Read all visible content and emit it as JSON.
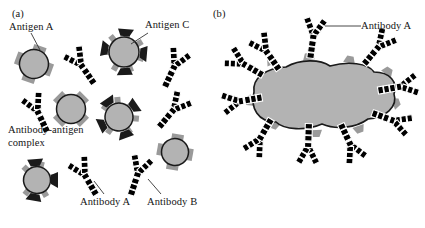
{
  "figure": {
    "background": "#ffffff",
    "width": 425,
    "height": 228
  },
  "panels": [
    {
      "id": "a",
      "label": "(a)",
      "label_pos": {
        "x": 12,
        "y": 10
      }
    },
    {
      "id": "b",
      "label": "(b)",
      "label_pos": {
        "x": 213,
        "y": 10
      }
    }
  ],
  "labels": {
    "antigen_a": "Antigen A",
    "antigen_c": "Antigen C",
    "antibody_antigen_complex": "Antibody-antigen complex",
    "antibody_a_panel_a": "Antibody A",
    "antibody_b_panel_a": "Antibody B",
    "antibody_a_panel_b": "Antibody A"
  },
  "colors": {
    "antigen_fill": "#b3b3b3",
    "antigen_stroke": "#1a1a1a",
    "epitope_gray": "#9a9a9a",
    "epitope_dark": "#1a1a1a",
    "antibody_dark": "#5a5a5a",
    "antibody_light": "#d2d2d2",
    "antibody_outline": "#ffffff",
    "leader_line": "#333333",
    "text": "#141414"
  },
  "legend_semantics": {
    "dark_antibody": "Antibody B",
    "light_antibody": "Antibody A",
    "round_tab_antigen": "Antigen A",
    "spiky_dark_antigen": "Antigen C",
    "large_blob_antigen": "large multivalent antigen"
  },
  "panel_a": {
    "antigens": [
      {
        "name": "antigen-a-labeled",
        "type": "square-tab",
        "cx": 34,
        "cy": 64,
        "r": 15,
        "rot": 20
      },
      {
        "name": "antigen-c-labeled",
        "type": "spiky-dark",
        "cx": 124,
        "cy": 52,
        "r": 16,
        "rot": 0
      },
      {
        "name": "antigen-complex-1",
        "type": "square-tab",
        "cx": 71,
        "cy": 109,
        "r": 15,
        "rot": 45
      },
      {
        "name": "antigen-spiky-2",
        "type": "spiky-dark",
        "cx": 119,
        "cy": 117,
        "r": 15,
        "rot": 15
      },
      {
        "name": "antigen-right",
        "type": "square-tab",
        "cx": 175,
        "cy": 152,
        "r": 14,
        "rot": 10
      },
      {
        "name": "antigen-bottom",
        "type": "spiky-dark",
        "cx": 37,
        "cy": 180,
        "r": 14,
        "rot": 30
      }
    ],
    "antibodies": [
      {
        "name": "antibody-b-top",
        "shade": "dark",
        "x": 79,
        "y": 62,
        "rot": -35,
        "scale": 1.0
      },
      {
        "name": "antibody-b-topright",
        "shade": "dark",
        "x": 176,
        "y": 63,
        "rot": 25,
        "scale": 1.0
      },
      {
        "name": "antibody-a-midleft",
        "shade": "light",
        "x": 36,
        "y": 108,
        "rot": -25,
        "scale": 1.0
      },
      {
        "name": "antibody-a-midright",
        "shade": "light",
        "x": 176,
        "y": 107,
        "rot": 40,
        "scale": 1.0
      },
      {
        "name": "antibody-a-labeled",
        "shade": "light",
        "x": 83,
        "y": 172,
        "rot": -30,
        "scale": 1.0
      },
      {
        "name": "antibody-b-labeled",
        "shade": "dark",
        "x": 139,
        "y": 170,
        "rot": 18,
        "scale": 1.0
      }
    ],
    "leaders": [
      {
        "name": "leader-antigen-a",
        "x1": 31,
        "y1": 33,
        "x2": 40,
        "y2": 50
      },
      {
        "name": "leader-antigen-c",
        "x1": 148,
        "y1": 33,
        "x2": 131,
        "y2": 44
      },
      {
        "name": "leader-antibody-a",
        "x1": 104,
        "y1": 194,
        "x2": 94,
        "y2": 180
      },
      {
        "name": "leader-antibody-b",
        "x1": 161,
        "y1": 194,
        "x2": 148,
        "y2": 178
      }
    ]
  },
  "panel_b": {
    "blob": {
      "name": "large-antigen-blob",
      "path": "M 254 92 C 252 78 266 68 286 67 C 300 59 320 59 330 66 C 348 61 368 63 374 72 C 390 72 398 82 394 94 C 398 106 386 118 368 119 C 356 128 336 130 322 124 C 306 131 284 130 276 122 C 258 122 250 108 254 92 Z",
      "tabs": [
        {
          "x": 273,
          "y": 64,
          "rot": -25
        },
        {
          "x": 309,
          "y": 60,
          "rot": -8
        },
        {
          "x": 349,
          "y": 63,
          "rot": 12
        },
        {
          "x": 386,
          "y": 74,
          "rot": 35
        },
        {
          "x": 392,
          "y": 104,
          "rot": 70
        },
        {
          "x": 358,
          "y": 126,
          "rot": 160
        },
        {
          "x": 316,
          "y": 130,
          "rot": 178
        },
        {
          "x": 275,
          "y": 122,
          "rot": 200
        },
        {
          "x": 252,
          "y": 100,
          "rot": 255
        }
      ]
    },
    "antibodies": [
      {
        "name": "antibody-b1",
        "shade": "light",
        "x": 314,
        "y": 32,
        "rot": 8
      },
      {
        "name": "antibody-b2",
        "shade": "light",
        "x": 264,
        "y": 48,
        "rot": -35
      },
      {
        "name": "antibody-b3",
        "shade": "light",
        "x": 240,
        "y": 62,
        "rot": -60
      },
      {
        "name": "antibody-b4",
        "shade": "light",
        "x": 236,
        "y": 102,
        "rot": -100
      },
      {
        "name": "antibody-b5",
        "shade": "light",
        "x": 258,
        "y": 142,
        "rot": -150
      },
      {
        "name": "antibody-b6",
        "shade": "light",
        "x": 308,
        "y": 150,
        "rot": 182
      },
      {
        "name": "antibody-b7",
        "shade": "light",
        "x": 352,
        "y": 148,
        "rot": 155
      },
      {
        "name": "antibody-b8",
        "shade": "light",
        "x": 397,
        "y": 122,
        "rot": 110
      },
      {
        "name": "antibody-b9",
        "shade": "light",
        "x": 404,
        "y": 86,
        "rot": 80
      },
      {
        "name": "antibody-b10",
        "shade": "light",
        "x": 381,
        "y": 44,
        "rot": 40
      }
    ],
    "leader": {
      "name": "leader-antibody-a-b",
      "x1": 325,
      "y1": 26,
      "x2": 360,
      "y2": 26
    }
  }
}
